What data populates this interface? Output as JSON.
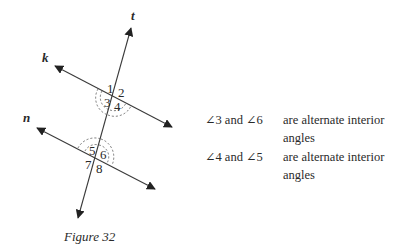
{
  "figure": {
    "caption": "Figure 32",
    "lines": [
      {
        "name": "t",
        "label": "t"
      },
      {
        "name": "k",
        "label": "k"
      },
      {
        "name": "n",
        "label": "n"
      }
    ],
    "angle_labels": [
      "1",
      "2",
      "3",
      "4",
      "5",
      "6",
      "7",
      "8"
    ]
  },
  "statements": [
    {
      "angles": "∠3 and ∠6",
      "desc_line1": "are alternate interior",
      "desc_line2": "angles"
    },
    {
      "angles": "∠4 and ∠5",
      "desc_line1": "are alternate interior",
      "desc_line2": "angles"
    }
  ],
  "colors": {
    "line": "#3a3a3a",
    "text": "#2a2a2a"
  }
}
